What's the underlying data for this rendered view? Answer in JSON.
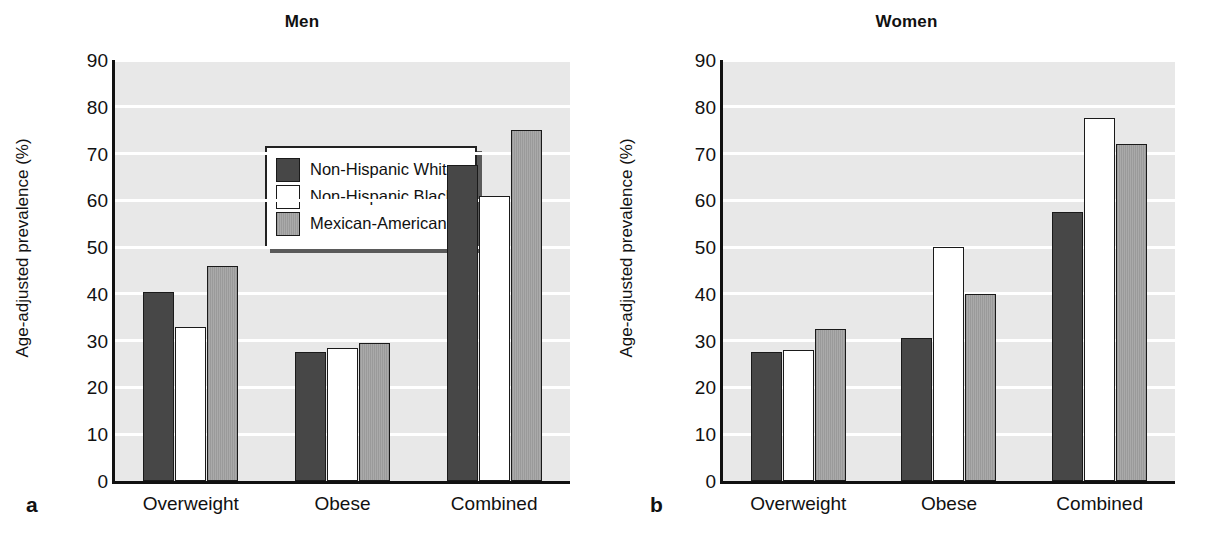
{
  "figure": {
    "panel_letters": {
      "a": "a",
      "b": "b"
    }
  },
  "legend": {
    "items": [
      {
        "label": "Non-Hispanic White",
        "color": "#474747",
        "swatch": "filled-dark-swatch"
      },
      {
        "label": "Non-Hispanic Black",
        "color": "#ffffff",
        "swatch": "empty-white-swatch"
      },
      {
        "label": "Mexican-American",
        "color": "#a0a0a0",
        "swatch": "hatched-grey-swatch"
      }
    ]
  },
  "chart_data": [
    {
      "type": "bar",
      "title": "Men",
      "panel": "a",
      "xlabel": "",
      "ylabel": "Age-adjusted prevalence (%)",
      "ylim": [
        0,
        90
      ],
      "yticks": [
        0,
        10,
        20,
        30,
        40,
        50,
        60,
        70,
        80,
        90
      ],
      "grid": true,
      "legend_position": "upper-left-inside",
      "categories": [
        "Overweight",
        "Obese",
        "Combined"
      ],
      "series": [
        {
          "name": "Non-Hispanic White",
          "color": "#474747",
          "values": [
            40.5,
            27.5,
            67.5
          ]
        },
        {
          "name": "Non-Hispanic Black",
          "color": "#ffffff",
          "values": [
            33.0,
            28.5,
            61.0
          ]
        },
        {
          "name": "Mexican-American",
          "color": "#a0a0a0",
          "values": [
            46.0,
            29.5,
            75.0
          ]
        }
      ]
    },
    {
      "type": "bar",
      "title": "Women",
      "panel": "b",
      "xlabel": "",
      "ylabel": "Age-adjusted prevalence (%)",
      "ylim": [
        0,
        90
      ],
      "yticks": [
        0,
        10,
        20,
        30,
        40,
        50,
        60,
        70,
        80,
        90
      ],
      "grid": true,
      "legend_position": "none",
      "categories": [
        "Overweight",
        "Obese",
        "Combined"
      ],
      "series": [
        {
          "name": "Non-Hispanic White",
          "color": "#474747",
          "values": [
            27.5,
            30.5,
            57.5
          ]
        },
        {
          "name": "Non-Hispanic Black",
          "color": "#ffffff",
          "values": [
            28.0,
            50.0,
            77.5
          ]
        },
        {
          "name": "Mexican-American",
          "color": "#a0a0a0",
          "values": [
            32.5,
            40.0,
            72.0
          ]
        }
      ]
    }
  ]
}
